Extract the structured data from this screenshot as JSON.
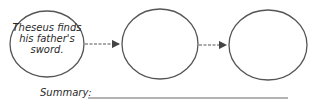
{
  "diagram": {
    "type": "sequence-chain",
    "nodes": [
      {
        "id": "event-1",
        "text": "Theseus finds his father's sword."
      },
      {
        "id": "event-2",
        "text": ""
      },
      {
        "id": "event-3",
        "text": ""
      }
    ],
    "edges": [
      {
        "from": "event-1",
        "to": "event-2"
      },
      {
        "from": "event-2",
        "to": "event-3"
      }
    ],
    "summary_label": "Summary:",
    "stroke_color": "#555555"
  }
}
